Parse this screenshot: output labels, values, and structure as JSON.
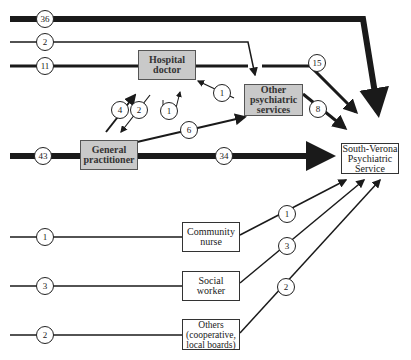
{
  "diagram": {
    "type": "referral-pathway",
    "nodes": {
      "hospital_doctor": "Hospital\ndoctor",
      "other_psychiatric": "Other\npsychiatric\nservices",
      "general_practitioner": "General\npractitioner",
      "south_verona": "South-Verona\nPsychiatric\nService",
      "community_nurse": "Community\nnurse",
      "social_worker": "Social\nworker",
      "others": "Others\n(cooperative,\nlocal boards)"
    },
    "flows": [
      {
        "from": "direct",
        "to": "south_verona",
        "value": "36"
      },
      {
        "from": "direct",
        "to": "other_psychiatric",
        "value": "2"
      },
      {
        "from": "direct",
        "to": "hospital_doctor",
        "value": "11"
      },
      {
        "from": "hospital_doctor",
        "to": "south_verona",
        "value": "15"
      },
      {
        "from": "other_psychiatric",
        "to": "hospital_doctor",
        "value": "1"
      },
      {
        "from": "other_psychiatric",
        "to": "south_verona",
        "value": "8"
      },
      {
        "from": "general_practitioner",
        "to": "hospital_doctor",
        "value": "4"
      },
      {
        "from": "hospital_doctor",
        "to": "general_practitioner",
        "value": "2"
      },
      {
        "from": "self_loop",
        "to": "hospital_doctor",
        "value": "1"
      },
      {
        "from": "general_practitioner",
        "to": "other_psychiatric",
        "value": "6"
      },
      {
        "from": "direct",
        "to": "general_practitioner",
        "value": "43"
      },
      {
        "from": "general_practitioner",
        "to": "south_verona",
        "value": "34"
      },
      {
        "from": "direct",
        "to": "community_nurse",
        "value": "1"
      },
      {
        "from": "community_nurse",
        "to": "south_verona",
        "value": "1"
      },
      {
        "from": "direct",
        "to": "social_worker",
        "value": "3"
      },
      {
        "from": "social_worker",
        "to": "south_verona",
        "value": "3"
      },
      {
        "from": "direct",
        "to": "others",
        "value": "2"
      },
      {
        "from": "others",
        "to": "south_verona",
        "value": "2"
      }
    ]
  }
}
